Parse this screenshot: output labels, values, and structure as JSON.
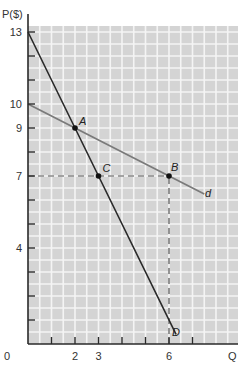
{
  "chart_data": {
    "type": "line",
    "title": "",
    "xlabel": "Q",
    "ylabel": "P($)",
    "xlim": [
      0,
      7.5
    ],
    "ylim": [
      0,
      13.5
    ],
    "grid": true,
    "x_ticks": [
      {
        "value": 0,
        "label": "0"
      },
      {
        "value": 2,
        "label": "2"
      },
      {
        "value": 3,
        "label": "3"
      },
      {
        "value": 6,
        "label": "6"
      }
    ],
    "x_tick_marks": [
      1,
      2,
      3,
      4,
      5,
      6,
      7
    ],
    "y_ticks": [
      {
        "value": 13,
        "label": "13"
      },
      {
        "value": 10,
        "label": "10"
      },
      {
        "value": 9,
        "label": "9"
      },
      {
        "value": 7,
        "label": "7"
      },
      {
        "value": 4,
        "label": "4"
      }
    ],
    "y_tick_marks": [
      1,
      2,
      3,
      4,
      5,
      6,
      7,
      8,
      9,
      10,
      11,
      12,
      13
    ],
    "series": [
      {
        "name": "D",
        "label": "D",
        "color": "#2a2a2a",
        "equation": "P = 13 - 2Q",
        "points": [
          [
            0,
            13
          ],
          [
            2,
            9
          ],
          [
            3,
            7
          ],
          [
            6.3,
            0.4
          ]
        ]
      },
      {
        "name": "d",
        "label": "d",
        "color": "#7a7a7a",
        "equation": "P = 10 - 0.5Q",
        "points": [
          [
            0,
            10
          ],
          [
            2,
            9
          ],
          [
            6,
            7
          ],
          [
            7.5,
            6.25
          ]
        ]
      }
    ],
    "points": [
      {
        "label": "A",
        "q": 2,
        "p": 9
      },
      {
        "label": "C",
        "q": 3,
        "p": 7
      },
      {
        "label": "B",
        "q": 6,
        "p": 7
      }
    ],
    "reference_lines": [
      {
        "type": "horizontal-dashed",
        "p": 7,
        "from_q": 0,
        "to_q": 6
      },
      {
        "type": "vertical-dashed",
        "q": 6,
        "from_p": 0,
        "to_p": 7
      }
    ],
    "annotations": [
      "A",
      "B",
      "C",
      "D",
      "d"
    ]
  },
  "labels": {
    "y_axis_title": "P($)",
    "x_axis_title": "Q",
    "origin": "0",
    "point_a": "A",
    "point_b": "B",
    "point_c": "C",
    "curve_D": "D",
    "curve_d": "d"
  },
  "colors": {
    "grid_bg": "#d4d4d4",
    "grid_line": "#f4f4f4",
    "axis": "#2a2a2a",
    "steep_line": "#2a2a2a",
    "flat_line": "#7a7a7a",
    "dashed": "#555555"
  }
}
